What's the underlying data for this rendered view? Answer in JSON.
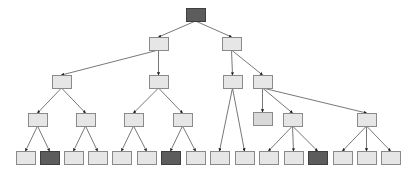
{
  "diagram": {
    "type": "tree",
    "title": "",
    "node_size": {
      "w": 19,
      "h": 13
    },
    "colors": {
      "light_fill": "#e6e6e6",
      "mid_fill": "#d9d9d9",
      "dark_fill": "#5c5c5c",
      "border": "#8a8a8a",
      "edge": "#555555"
    },
    "nodes": [
      {
        "id": "root",
        "x": 186,
        "y": 8,
        "style": "dark"
      },
      {
        "id": "L1a",
        "x": 149,
        "y": 37,
        "style": "light"
      },
      {
        "id": "L1b",
        "x": 222,
        "y": 37,
        "style": "light"
      },
      {
        "id": "L2a",
        "x": 52,
        "y": 75,
        "style": "light"
      },
      {
        "id": "L2b",
        "x": 149,
        "y": 75,
        "style": "light"
      },
      {
        "id": "L2c",
        "x": 223,
        "y": 75,
        "style": "light"
      },
      {
        "id": "L2d",
        "x": 253,
        "y": 75,
        "style": "light"
      },
      {
        "id": "L3a",
        "x": 28,
        "y": 113,
        "style": "light"
      },
      {
        "id": "L3b",
        "x": 76,
        "y": 113,
        "style": "light"
      },
      {
        "id": "L3c",
        "x": 124,
        "y": 113,
        "style": "light"
      },
      {
        "id": "L3d",
        "x": 173,
        "y": 113,
        "style": "light"
      },
      {
        "id": "L3e",
        "x": 253,
        "y": 112,
        "style": "mid"
      },
      {
        "id": "L3f",
        "x": 283,
        "y": 113,
        "style": "light"
      },
      {
        "id": "L3g",
        "x": 357,
        "y": 113,
        "style": "light"
      },
      {
        "id": "F1",
        "x": 16,
        "y": 151,
        "style": "light"
      },
      {
        "id": "F2",
        "x": 40,
        "y": 151,
        "style": "dark"
      },
      {
        "id": "F3",
        "x": 64,
        "y": 151,
        "style": "light"
      },
      {
        "id": "F4",
        "x": 88,
        "y": 151,
        "style": "light"
      },
      {
        "id": "F5",
        "x": 112,
        "y": 151,
        "style": "light"
      },
      {
        "id": "F6",
        "x": 137,
        "y": 151,
        "style": "light"
      },
      {
        "id": "F7",
        "x": 161,
        "y": 151,
        "style": "dark"
      },
      {
        "id": "F8",
        "x": 186,
        "y": 151,
        "style": "light"
      },
      {
        "id": "F9",
        "x": 210,
        "y": 151,
        "style": "light"
      },
      {
        "id": "F10",
        "x": 235,
        "y": 151,
        "style": "light"
      },
      {
        "id": "F11",
        "x": 259,
        "y": 151,
        "style": "light"
      },
      {
        "id": "F12",
        "x": 284,
        "y": 151,
        "style": "light"
      },
      {
        "id": "F13",
        "x": 308,
        "y": 151,
        "style": "dark"
      },
      {
        "id": "F14",
        "x": 333,
        "y": 151,
        "style": "light"
      },
      {
        "id": "F15",
        "x": 357,
        "y": 151,
        "style": "light"
      },
      {
        "id": "F16",
        "x": 381,
        "y": 151,
        "style": "light"
      }
    ],
    "edges": [
      [
        "root",
        "L1a"
      ],
      [
        "root",
        "L1b"
      ],
      [
        "L1a",
        "L2a"
      ],
      [
        "L1a",
        "L2b"
      ],
      [
        "L1b",
        "L2c"
      ],
      [
        "L1b",
        "L2d"
      ],
      [
        "L2a",
        "L3a"
      ],
      [
        "L2a",
        "L3b"
      ],
      [
        "L2b",
        "L3c"
      ],
      [
        "L2b",
        "L3d"
      ],
      [
        "L2c",
        "F9"
      ],
      [
        "L2c",
        "F10"
      ],
      [
        "L2d",
        "L3e"
      ],
      [
        "L2d",
        "L3f"
      ],
      [
        "L2d",
        "L3g"
      ],
      [
        "L3a",
        "F1"
      ],
      [
        "L3a",
        "F2"
      ],
      [
        "L3b",
        "F3"
      ],
      [
        "L3b",
        "F4"
      ],
      [
        "L3c",
        "F5"
      ],
      [
        "L3c",
        "F6"
      ],
      [
        "L3d",
        "F7"
      ],
      [
        "L3d",
        "F8"
      ],
      [
        "L3f",
        "F11"
      ],
      [
        "L3f",
        "F12"
      ],
      [
        "L3f",
        "F13"
      ],
      [
        "L3g",
        "F14"
      ],
      [
        "L3g",
        "F15"
      ],
      [
        "L3g",
        "F16"
      ]
    ]
  }
}
